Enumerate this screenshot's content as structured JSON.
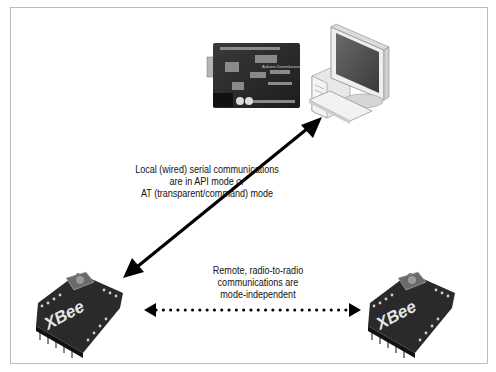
{
  "diagram": {
    "nodes": [
      {
        "id": "arduino",
        "name": "Arduino Duemilanove board"
      },
      {
        "id": "computer",
        "name": "Desktop computer"
      },
      {
        "id": "xbee_left",
        "name": "XBee radio (local)",
        "logo": "XBee"
      },
      {
        "id": "xbee_right",
        "name": "XBee radio (remote)",
        "logo": "XBee"
      }
    ],
    "edges": [
      {
        "from": "xbee_left",
        "to": "computer",
        "style": "solid",
        "direction": "bidirectional"
      },
      {
        "from": "xbee_left",
        "to": "xbee_right",
        "style": "dotted",
        "direction": "bidirectional"
      }
    ],
    "labels": {
      "local": {
        "line1": "Local (wired) serial communications",
        "line2_pre": "are in API mode ",
        "line2_em": "or",
        "line3": "AT (transparent/command) mode"
      },
      "remote": {
        "line1": "Remote, radio-to-radio",
        "line2": "communications are",
        "line3": "mode-independent"
      }
    },
    "xbee_logo_text": "XBee",
    "arduino_text": "Arduino Duemilanove"
  }
}
